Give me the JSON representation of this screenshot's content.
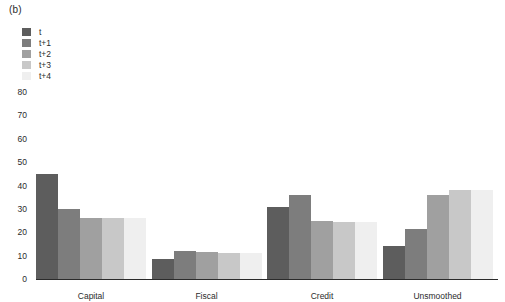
{
  "panel": {
    "label": "(b)"
  },
  "legend": {
    "position": "top-left",
    "items": [
      {
        "label": "t",
        "color": "#5d5d5d"
      },
      {
        "label": "t+1",
        "color": "#7d7d7d"
      },
      {
        "label": "t+2",
        "color": "#a0a0a0"
      },
      {
        "label": "t+3",
        "color": "#c8c8c8"
      },
      {
        "label": "t+4",
        "color": "#efefef"
      }
    ]
  },
  "chart_data": {
    "type": "bar",
    "title": "",
    "xlabel": "",
    "ylabel": "",
    "categories": [
      "Capital",
      "Fiscal",
      "Credit",
      "Unsmoothed"
    ],
    "series": [
      {
        "name": "t",
        "color": "#5d5d5d",
        "values": [
          45,
          8.5,
          31,
          14
        ]
      },
      {
        "name": "t+1",
        "color": "#7d7d7d",
        "values": [
          30,
          12,
          36,
          21.5
        ]
      },
      {
        "name": "t+2",
        "color": "#a0a0a0",
        "values": [
          26,
          11.5,
          25,
          36
        ]
      },
      {
        "name": "t+3",
        "color": "#c8c8c8",
        "values": [
          26,
          11,
          24.5,
          38
        ]
      },
      {
        "name": "t+4",
        "color": "#efefef",
        "values": [
          26,
          11,
          24.5,
          38
        ]
      }
    ],
    "ylim": [
      0,
      80
    ],
    "yticks": [
      0,
      10,
      20,
      30,
      40,
      50,
      60,
      70,
      80
    ],
    "ytick_labels": [
      "0",
      "10",
      "20",
      "30",
      "40",
      "50",
      "60",
      "70",
      "80"
    ],
    "grid": false,
    "legend_position": "top-left"
  }
}
